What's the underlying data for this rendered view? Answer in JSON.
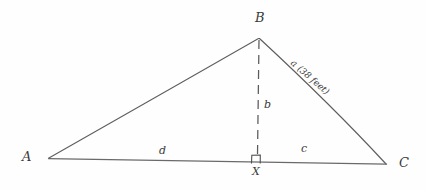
{
  "figure": {
    "type": "geometry-diagram",
    "background_color": "#fefefe",
    "ink_color": "#555555",
    "text_color": "#3a3a3a"
  },
  "vertices": {
    "a": {
      "label": "A",
      "x": 48,
      "y": 158
    },
    "b": {
      "label": "B",
      "x": 259,
      "y": 38
    },
    "c": {
      "label": "C",
      "x": 386,
      "y": 164
    },
    "x": {
      "label": "X",
      "x": 257,
      "y": 160
    }
  },
  "segments": {
    "altitude": {
      "label": "b",
      "style": "dashed"
    },
    "base_left": {
      "label": "d"
    },
    "base_right": {
      "label": "c"
    },
    "hypotenuse_right": {
      "label": "a",
      "measure": "(38 feet)"
    }
  },
  "markers": {
    "right_angle": {
      "name": "right-angle-square",
      "at": "X"
    }
  }
}
